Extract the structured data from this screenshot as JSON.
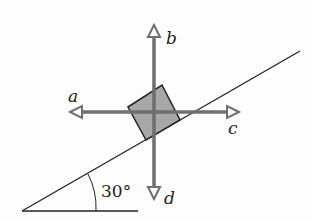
{
  "diagram": {
    "incline_angle_label": "30°",
    "vectors": [
      {
        "id": "a",
        "label": "a",
        "direction": "left"
      },
      {
        "id": "b",
        "label": "b",
        "direction": "up"
      },
      {
        "id": "c",
        "label": "c",
        "direction": "right"
      },
      {
        "id": "d",
        "label": "d",
        "direction": "down"
      }
    ],
    "colors": {
      "arrow": "#6e6e6e",
      "block_fill": "#a8a8a8",
      "block_stroke": "#222222",
      "line": "#222222"
    }
  }
}
